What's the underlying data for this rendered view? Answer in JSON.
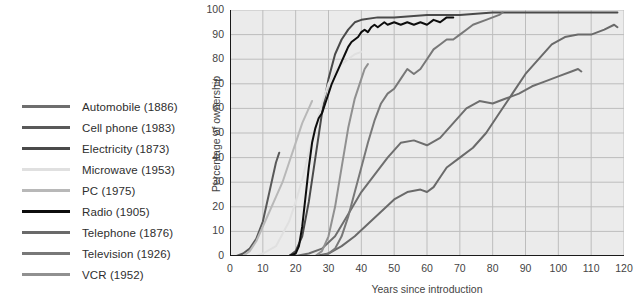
{
  "chart_data": {
    "type": "line",
    "title": "",
    "xlabel": "Years since introduction",
    "ylabel": "Percentage of ownership",
    "xlim": [
      0,
      120
    ],
    "ylim": [
      0,
      100
    ],
    "xticks": [
      0,
      10,
      20,
      30,
      40,
      50,
      60,
      70,
      80,
      90,
      100,
      110,
      120
    ],
    "yticks": [
      0,
      10,
      20,
      30,
      40,
      50,
      60,
      70,
      80,
      90,
      100
    ],
    "grid": true,
    "legend_position": "left-outside",
    "series": [
      {
        "name": "Automobile (1886)",
        "label": "Automobile (1886)",
        "year": 1886,
        "color": "#6e6e6e",
        "points": [
          [
            0,
            0
          ],
          [
            20,
            0
          ],
          [
            24,
            1
          ],
          [
            28,
            3
          ],
          [
            32,
            8
          ],
          [
            36,
            17
          ],
          [
            40,
            26
          ],
          [
            44,
            33
          ],
          [
            48,
            40
          ],
          [
            52,
            46
          ],
          [
            56,
            47
          ],
          [
            60,
            45
          ],
          [
            64,
            48
          ],
          [
            68,
            54
          ],
          [
            72,
            60
          ],
          [
            76,
            63
          ],
          [
            80,
            62
          ],
          [
            84,
            64
          ],
          [
            88,
            66
          ],
          [
            92,
            69
          ],
          [
            96,
            71
          ],
          [
            100,
            73
          ],
          [
            104,
            75
          ],
          [
            106,
            76
          ],
          [
            107,
            75
          ]
        ]
      },
      {
        "name": "Cell phone (1983)",
        "label": "Cell phone (1983)",
        "year": 1983,
        "color": "#595959",
        "points": [
          [
            0,
            0
          ],
          [
            2,
            0
          ],
          [
            4,
            1
          ],
          [
            6,
            3
          ],
          [
            8,
            7
          ],
          [
            10,
            14
          ],
          [
            11,
            20
          ],
          [
            12,
            26
          ],
          [
            13,
            32
          ],
          [
            14,
            38
          ],
          [
            15,
            42
          ]
        ]
      },
      {
        "name": "Electricity (1873)",
        "label": "Electricity (1873)",
        "year": 1873,
        "color": "#4a4a4a",
        "points": [
          [
            0,
            0
          ],
          [
            18,
            0
          ],
          [
            20,
            2
          ],
          [
            22,
            8
          ],
          [
            24,
            22
          ],
          [
            26,
            40
          ],
          [
            28,
            58
          ],
          [
            30,
            72
          ],
          [
            32,
            82
          ],
          [
            34,
            88
          ],
          [
            36,
            92
          ],
          [
            38,
            95
          ],
          [
            40,
            96
          ],
          [
            45,
            97
          ],
          [
            50,
            97
          ],
          [
            60,
            98
          ],
          [
            70,
            98
          ],
          [
            80,
            99
          ],
          [
            90,
            99
          ],
          [
            100,
            99
          ],
          [
            110,
            99
          ],
          [
            118,
            99
          ]
        ]
      },
      {
        "name": "Microwave (1953)",
        "label": "Microwave (1953)",
        "year": 1953,
        "color": "#e0e0e0",
        "points": [
          [
            0,
            0
          ],
          [
            8,
            0
          ],
          [
            10,
            1
          ],
          [
            14,
            4
          ],
          [
            18,
            14
          ],
          [
            20,
            22
          ],
          [
            22,
            31
          ],
          [
            24,
            42
          ],
          [
            26,
            52
          ],
          [
            28,
            62
          ],
          [
            30,
            70
          ],
          [
            32,
            75
          ],
          [
            34,
            78
          ],
          [
            36,
            80
          ],
          [
            38,
            82
          ],
          [
            40,
            83
          ]
        ]
      },
      {
        "name": "PC (1975)",
        "label": "PC (1975)",
        "year": 1975,
        "color": "#b8b8b8",
        "points": [
          [
            0,
            0
          ],
          [
            4,
            0
          ],
          [
            6,
            2
          ],
          [
            8,
            6
          ],
          [
            10,
            12
          ],
          [
            12,
            18
          ],
          [
            14,
            24
          ],
          [
            16,
            30
          ],
          [
            18,
            38
          ],
          [
            20,
            46
          ],
          [
            22,
            54
          ],
          [
            24,
            60
          ],
          [
            25,
            63
          ]
        ]
      },
      {
        "name": "Radio (1905)",
        "label": "Radio (1905)",
        "year": 1905,
        "color": "#0d0d0d",
        "points": [
          [
            0,
            0
          ],
          [
            18,
            0
          ],
          [
            20,
            1
          ],
          [
            21,
            4
          ],
          [
            22,
            12
          ],
          [
            23,
            24
          ],
          [
            24,
            36
          ],
          [
            25,
            46
          ],
          [
            26,
            52
          ],
          [
            27,
            56
          ],
          [
            28,
            58
          ],
          [
            29,
            62
          ],
          [
            30,
            66
          ],
          [
            31,
            70
          ],
          [
            32,
            73
          ],
          [
            33,
            76
          ],
          [
            34,
            79
          ],
          [
            35,
            82
          ],
          [
            36,
            85
          ],
          [
            37,
            87
          ],
          [
            38,
            88
          ],
          [
            39,
            89
          ],
          [
            40,
            91
          ],
          [
            41,
            92
          ],
          [
            42,
            91
          ],
          [
            43,
            93
          ],
          [
            44,
            94
          ],
          [
            45,
            93
          ],
          [
            46,
            94
          ],
          [
            47,
            95
          ],
          [
            48,
            94
          ],
          [
            50,
            95
          ],
          [
            52,
            94
          ],
          [
            54,
            95
          ],
          [
            56,
            94
          ],
          [
            58,
            95
          ],
          [
            60,
            94
          ],
          [
            62,
            96
          ],
          [
            64,
            95
          ],
          [
            66,
            97
          ],
          [
            68,
            97
          ]
        ]
      },
      {
        "name": "Telephone (1876)",
        "label": "Telephone (1876)",
        "year": 1876,
        "color": "#6a6a6a",
        "points": [
          [
            0,
            0
          ],
          [
            26,
            0
          ],
          [
            30,
            1
          ],
          [
            34,
            4
          ],
          [
            38,
            8
          ],
          [
            42,
            13
          ],
          [
            46,
            18
          ],
          [
            50,
            23
          ],
          [
            54,
            26
          ],
          [
            58,
            27
          ],
          [
            60,
            26
          ],
          [
            62,
            28
          ],
          [
            64,
            32
          ],
          [
            66,
            36
          ],
          [
            70,
            40
          ],
          [
            74,
            44
          ],
          [
            78,
            50
          ],
          [
            82,
            58
          ],
          [
            86,
            66
          ],
          [
            90,
            74
          ],
          [
            94,
            80
          ],
          [
            98,
            86
          ],
          [
            102,
            89
          ],
          [
            106,
            90
          ],
          [
            110,
            90
          ],
          [
            114,
            92
          ],
          [
            117,
            94
          ],
          [
            118,
            93
          ]
        ]
      },
      {
        "name": "Television (1926)",
        "label": "Television (1926)",
        "year": 1926,
        "color": "#787878",
        "points": [
          [
            0,
            0
          ],
          [
            28,
            0
          ],
          [
            30,
            1
          ],
          [
            32,
            3
          ],
          [
            34,
            8
          ],
          [
            36,
            16
          ],
          [
            38,
            26
          ],
          [
            40,
            36
          ],
          [
            42,
            46
          ],
          [
            44,
            55
          ],
          [
            46,
            62
          ],
          [
            48,
            66
          ],
          [
            50,
            68
          ],
          [
            52,
            72
          ],
          [
            54,
            76
          ],
          [
            56,
            74
          ],
          [
            58,
            76
          ],
          [
            60,
            80
          ],
          [
            62,
            84
          ],
          [
            64,
            86
          ],
          [
            66,
            88
          ],
          [
            68,
            88
          ],
          [
            70,
            90
          ],
          [
            72,
            92
          ],
          [
            74,
            94
          ],
          [
            78,
            96
          ],
          [
            82,
            98
          ],
          [
            83,
            99
          ]
        ]
      },
      {
        "name": "VCR (1952)",
        "label": "VCR (1952)",
        "year": 1952,
        "color": "#909090",
        "points": [
          [
            0,
            0
          ],
          [
            26,
            0
          ],
          [
            28,
            2
          ],
          [
            30,
            8
          ],
          [
            32,
            20
          ],
          [
            34,
            36
          ],
          [
            36,
            52
          ],
          [
            38,
            64
          ],
          [
            40,
            72
          ],
          [
            41,
            76
          ],
          [
            42,
            78
          ]
        ]
      }
    ]
  },
  "axis": {
    "y_title": "Percentage of ownership",
    "x_title": "Years since introduction",
    "y_tick_labels": [
      "0",
      "10",
      "20",
      "30",
      "40",
      "50",
      "60",
      "70",
      "80",
      "90",
      "100"
    ],
    "x_tick_labels": [
      "0",
      "10",
      "20",
      "30",
      "40",
      "50",
      "60",
      "70",
      "80",
      "90",
      "100",
      "110",
      "120"
    ]
  },
  "legend": {
    "items": [
      {
        "label": "Automobile (1886)",
        "color": "#6e6e6e"
      },
      {
        "label": "Cell phone (1983)",
        "color": "#595959"
      },
      {
        "label": "Electricity (1873)",
        "color": "#4a4a4a"
      },
      {
        "label": "Microwave (1953)",
        "color": "#e0e0e0"
      },
      {
        "label": "PC (1975)",
        "color": "#b8b8b8"
      },
      {
        "label": "Radio (1905)",
        "color": "#0d0d0d"
      },
      {
        "label": "Telephone (1876)",
        "color": "#6a6a6a"
      },
      {
        "label": "Television (1926)",
        "color": "#787878"
      },
      {
        "label": "VCR (1952)",
        "color": "#909090"
      }
    ]
  },
  "style": {
    "plot_background": "#ebebeb",
    "grid_color": "#bdbdbd",
    "axis_color": "#1a1a1a",
    "page_background": "#ffffff",
    "text_color": "#3a3a3a"
  }
}
